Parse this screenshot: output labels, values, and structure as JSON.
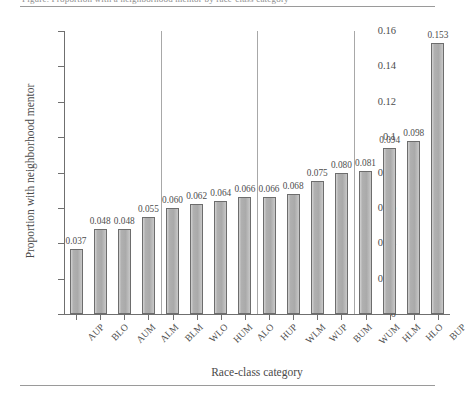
{
  "figure": {
    "caption_remnant": "Figure. Proportion with a neighborhood mentor by race-class category",
    "rule_top": "horizontal-rule",
    "rule_bottom": "horizontal-rule"
  },
  "chart_data": {
    "type": "bar",
    "title": "",
    "xlabel": "Race-class category",
    "ylabel": "Proportion with neighborhood mentor",
    "categories": [
      "AUP",
      "BLO",
      "AUM",
      "ALM",
      "BLM",
      "WLO",
      "HUM",
      "ALO",
      "HUP",
      "WLM",
      "WUP",
      "BUM",
      "WUM",
      "HLM",
      "HLO",
      "BUP"
    ],
    "values": [
      0.037,
      0.048,
      0.048,
      0.055,
      0.06,
      0.062,
      0.064,
      0.066,
      0.066,
      0.068,
      0.075,
      0.08,
      0.081,
      0.094,
      0.098,
      0.153
    ],
    "value_labels": [
      "0.037",
      "0.048",
      "0.048",
      "0.055",
      "0.060",
      "0.062",
      "0.064",
      "0.066",
      "0.066",
      "0.068",
      "0.075",
      "0.080",
      "0.081",
      "0.094",
      "0.098",
      "0.153"
    ],
    "ylim": [
      0,
      0.16
    ],
    "yticks": [
      0,
      0.02,
      0.04,
      0.06,
      0.08,
      0.1,
      0.12,
      0.14,
      0.16
    ],
    "ytick_labels": [
      "0",
      "0.02",
      "0.04",
      "0.06",
      "0.08",
      "0.1",
      "0.12",
      "0.14",
      "0.16"
    ],
    "grid": false,
    "legend": "none",
    "group_separators_after": [
      3,
      7,
      11
    ],
    "bar_color": "#b2b2b2",
    "bar_edge_color": "#6d6d6d",
    "axis_color": "#6f6f6f",
    "separator_color": "#a8a8a8"
  }
}
